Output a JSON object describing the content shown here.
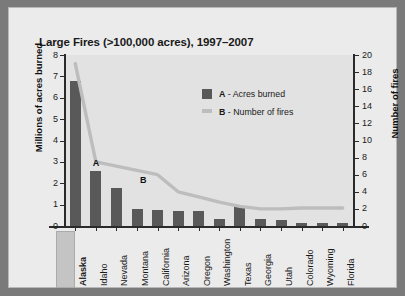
{
  "chart_data": {
    "type": "bar",
    "title": "Large Fires (>100,000 acres), 1997–2007",
    "categories": [
      "Alaska",
      "Idaho",
      "Nevada",
      "Montana",
      "California",
      "Arizona",
      "Oregon",
      "Washington",
      "Texas",
      "Georgia",
      "Utah",
      "Colorado",
      "Wyoming",
      "Florida"
    ],
    "xlabel": "",
    "grid": false,
    "legend_position": "inside-top-right",
    "highlighted_category": "Alaska",
    "annotations": [
      {
        "label": "A",
        "x": "Idaho",
        "note": "points to Acres burned bars"
      },
      {
        "label": "B",
        "x": "Montana",
        "note": "points to Number of fires line"
      }
    ],
    "axes": {
      "left": {
        "label": "Millions of acres burned",
        "min": 0,
        "max": 8,
        "step": 1,
        "ticks": [
          "0",
          "1",
          "2",
          "3",
          "4",
          "5",
          "6",
          "7",
          "8"
        ]
      },
      "right": {
        "label": "Number of fires",
        "min": 0,
        "max": 20,
        "step": 2,
        "ticks": [
          "0",
          "2",
          "4",
          "6",
          "8",
          "10",
          "12",
          "14",
          "16",
          "18",
          "20"
        ]
      }
    },
    "series": [
      {
        "name": "A - Acres burned",
        "key": "A",
        "legend_label": "Acres burned",
        "type": "bar",
        "axis": "left",
        "color": "#595959",
        "unit": "millions of acres",
        "values": [
          6.8,
          2.55,
          1.8,
          0.8,
          0.75,
          0.72,
          0.7,
          0.35,
          0.95,
          0.35,
          0.3,
          0.15,
          0.15,
          0.12
        ]
      },
      {
        "name": "B - Number of fires",
        "key": "B",
        "legend_label": "Number of fires",
        "type": "line",
        "axis": "right",
        "color": "#bdbdbd",
        "unit": "fires",
        "values": [
          19,
          7.5,
          7,
          6.5,
          6,
          4,
          3.4,
          2.8,
          2.3,
          2,
          2,
          2.1,
          2.1,
          2.1
        ]
      }
    ]
  },
  "legend": {
    "items": [
      {
        "key": "A",
        "dash": "-",
        "label": "Acres burned"
      },
      {
        "key": "B",
        "dash": "-",
        "label": "Number of fires"
      }
    ]
  }
}
